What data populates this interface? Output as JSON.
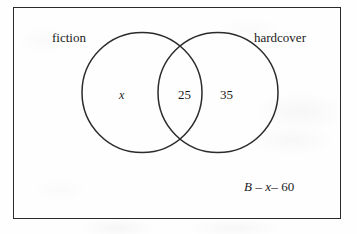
{
  "diagram": {
    "type": "venn-2-set",
    "title": "",
    "universal_set_label": "B",
    "frame": {
      "shape": "rectangle",
      "stroke_color": "#2b2b2b"
    },
    "sets": [
      {
        "id": "fiction",
        "label": "fiction",
        "position": "left",
        "exclusive_value": "x"
      },
      {
        "id": "hardcover",
        "label": "hardcover",
        "position": "right",
        "exclusive_value": "35"
      }
    ],
    "intersection": {
      "label": "fiction-and-hardcover",
      "value": "25"
    },
    "annotation": {
      "parts": [
        {
          "text": "B",
          "style": "italic"
        },
        {
          "text": " – ",
          "style": "normal"
        },
        {
          "text": "x",
          "style": "italic"
        },
        {
          "text": "– 60",
          "style": "normal"
        }
      ],
      "plain_text": "B – x– 60"
    }
  },
  "colors": {
    "ink": "#2b2b2b",
    "paper": "#fefefe"
  }
}
